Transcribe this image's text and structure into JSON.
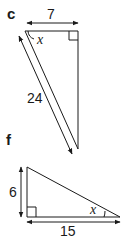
{
  "diagrams": [
    {
      "part": "c",
      "sides": {
        "top": "7",
        "hypotenuse": "24"
      },
      "angle_label": "x",
      "right_angle": "top-right"
    },
    {
      "part": "f",
      "sides": {
        "vertical": "6",
        "base": "15"
      },
      "angle_label": "x",
      "right_angle": "bottom-left"
    }
  ],
  "colors": {
    "stroke": "#1a1a1a",
    "background": "#ffffff"
  }
}
